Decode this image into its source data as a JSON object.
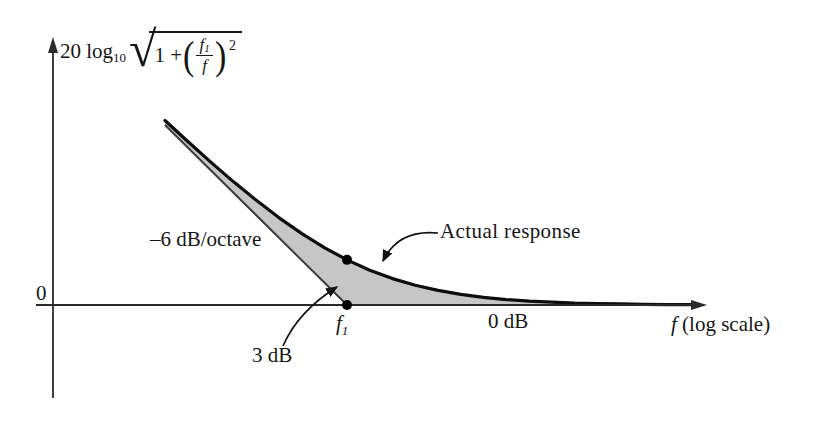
{
  "figure": {
    "origin_label": "0",
    "slope_label": "–6 dB/octave",
    "actual_response_label": "Actual response",
    "three_db_label": "3 dB",
    "zero_db_label": "0 dB",
    "f1_label_f": "f",
    "f1_label_sub": "1",
    "x_axis_label_f": "f",
    "x_axis_label_rest": " (log scale)",
    "ylabel": {
      "prefix": "20 log",
      "prefix_sub": "10",
      "radical": "√",
      "radicand_pre": "1  +",
      "open_paren": "(",
      "frac_num_f": "f",
      "frac_num_sub": "1",
      "frac_den": "f",
      "close_paren": ")",
      "exponent": "2"
    }
  },
  "colors": {
    "background": "#ffffff",
    "shading": "#c6c6c6",
    "curve": "#0d0d0d",
    "asymptote": "#3c3c3c",
    "axis": "#2b2b2b",
    "arrow": "#111111",
    "dot": "#000000"
  },
  "chart_data": {
    "type": "line",
    "xlabel": "f (log scale)",
    "ylabel": "20 log10 sqrt(1 + (f1/f)^2)  [dB]",
    "x_unit": "octaves relative to f1 (f = f1 * 2^x)",
    "x_range_octaves": [
      -3.4,
      3.95
    ],
    "y_range_dB": [
      -6,
      17
    ],
    "grid": false,
    "legend": "none (annotated with arrows)",
    "series": [
      {
        "name": "-6 dB/octave asymptote",
        "style": "thin straight line",
        "x": [
          -2,
          0
        ],
        "y": [
          12,
          0
        ]
      },
      {
        "name": "Actual response",
        "style": "thick curve",
        "x": [
          -2,
          -1.75,
          -1.5,
          -1.25,
          -1,
          -0.75,
          -0.5,
          -0.25,
          0,
          0.25,
          0.5,
          0.75,
          1,
          1.25,
          1.5,
          1.75,
          2,
          2.25,
          2.5,
          2.75,
          3,
          3.25,
          3.5,
          3.8
        ],
        "y": [
          12.3,
          10.9,
          9.54,
          8.23,
          6.99,
          5.83,
          4.77,
          3.83,
          3.01,
          2.32,
          1.76,
          1.32,
          0.97,
          0.71,
          0.51,
          0.36,
          0.26,
          0.19,
          0.13,
          0.09,
          0.07,
          0.05,
          0.03,
          0.02
        ]
      }
    ],
    "markers": [
      {
        "x": 0,
        "y": 3.01,
        "label": "3 dB point on actual response at f1"
      },
      {
        "x": 0,
        "y": 0,
        "label": "f1 corner frequency on axis"
      }
    ],
    "shaded_region": "area between actual response curve and the asymptote / 0 dB axis",
    "annotations": [
      {
        "text": "–6 dB/octave",
        "target": "asymptote slope"
      },
      {
        "text": "Actual response",
        "target": "curve",
        "arrow": true
      },
      {
        "text": "3 dB",
        "target": "gap between curve and axis at f1",
        "arrow": true
      },
      {
        "text": "f1",
        "target": "x-axis corner frequency"
      },
      {
        "text": "0 dB",
        "target": "high-frequency flat level"
      },
      {
        "text": "0",
        "target": "origin"
      }
    ]
  }
}
